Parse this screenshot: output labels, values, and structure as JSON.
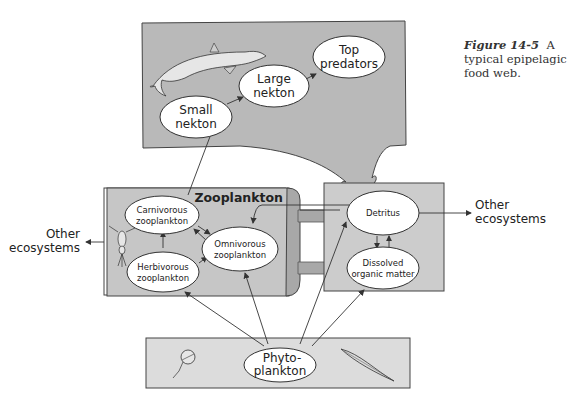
{
  "caption": {
    "figure_label": "Figure 14-5",
    "text": "A typical epipelagic food web."
  },
  "colors": {
    "box_fill": "#b9b9b9",
    "box_fill_light": "#d4d4d4",
    "phyto_fill": "#dcdcdc",
    "node_fill": "#ffffff",
    "line": "#333333"
  },
  "boxes": {
    "zooplankton_title": "Zooplankton"
  },
  "nodes": {
    "small_nekton": [
      "Small",
      "nekton"
    ],
    "large_nekton": [
      "Large",
      "nekton"
    ],
    "top_predators": [
      "Top",
      "predators"
    ],
    "carnivorous": [
      "Carnivorous",
      "zooplankton"
    ],
    "herbivorous": [
      "Herbivorous",
      "zooplankton"
    ],
    "omnivorous": [
      "Omnivorous",
      "zooplankton"
    ],
    "detritus": [
      "Detritus"
    ],
    "dissolved": [
      "Dissolved",
      "organic matter"
    ],
    "phytoplankton": [
      "Phyto-",
      "plankton"
    ]
  },
  "external": {
    "left": [
      "Other",
      "ecosystems"
    ],
    "right": [
      "Other",
      "ecosystems"
    ]
  },
  "illustrations": [
    "dolphin",
    "copepod",
    "dinoflagellate",
    "diatom"
  ]
}
